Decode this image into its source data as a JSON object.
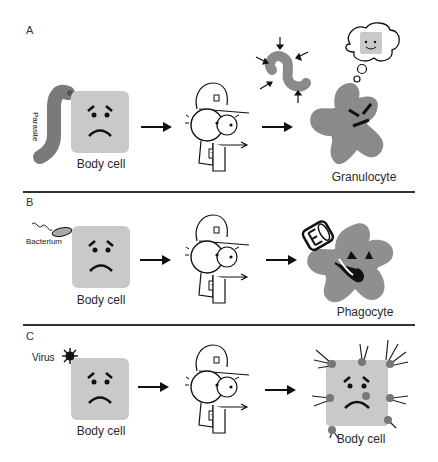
{
  "panels": [
    {
      "label": "A",
      "pathogen_label": "Parasite",
      "cell_caption": "Body cell",
      "responder_caption": "Granulocyte"
    },
    {
      "label": "B",
      "pathogen_label": "Bacterium",
      "cell_caption": "Body cell",
      "responder_caption": "Phagocyte"
    },
    {
      "label": "C",
      "pathogen_label": "Virus",
      "cell_caption": "Body cell",
      "responder_caption": "Body cell"
    }
  ],
  "colors": {
    "cell_fill": "#c9c9c9",
    "immune_fill": "#8a8a8a",
    "line": "#222222"
  },
  "icons": {
    "detective": "T-cell detective pointing",
    "arrow": "right-arrow"
  }
}
